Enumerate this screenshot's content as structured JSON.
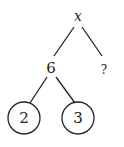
{
  "diagram": {
    "type": "factor-tree",
    "root": {
      "label": "x"
    },
    "left_child": {
      "label": "6"
    },
    "right_child": {
      "label": "?"
    },
    "leaves": [
      {
        "label": "2",
        "circled": true
      },
      {
        "label": "3",
        "circled": true
      }
    ],
    "colors": {
      "stroke": "#222222",
      "background": "#ffffff"
    }
  }
}
